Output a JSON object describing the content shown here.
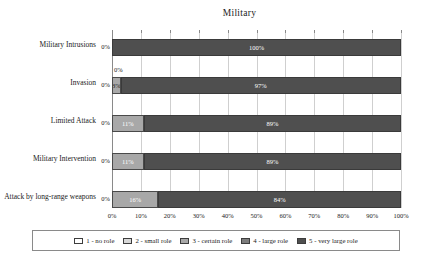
{
  "chart_data": {
    "type": "bar",
    "orientation": "horizontal",
    "stacked": true,
    "title": "Military",
    "xlabel": "",
    "ylabel": "",
    "xlim": [
      0,
      100
    ],
    "xticks": [
      "0%",
      "10%",
      "20%",
      "30%",
      "40%",
      "50%",
      "60%",
      "70%",
      "80%",
      "90%",
      "100%"
    ],
    "grid": true,
    "legend_position": "bottom",
    "categories": [
      "Military Intrusions",
      "Invasion",
      "Limited Attack",
      "Military Intervention",
      "Attack by long-range weapons"
    ],
    "series": [
      {
        "name": "1 - no role",
        "values": [
          0,
          0,
          0,
          0,
          0
        ]
      },
      {
        "name": "2 - small role",
        "values": [
          0,
          0,
          0,
          0,
          0
        ]
      },
      {
        "name": "3 - certain role",
        "values": [
          0,
          3,
          11,
          11,
          16
        ]
      },
      {
        "name": "4 - large role",
        "values": [
          0,
          0,
          0,
          0,
          0
        ]
      },
      {
        "name": "5 - very large role",
        "values": [
          100,
          97,
          89,
          89,
          84
        ]
      }
    ],
    "data_labels": {
      "Military Intrusions": [
        "0%",
        "100%"
      ],
      "Invasion": [
        "0%",
        "0%",
        "3%",
        "97%"
      ],
      "Limited Attack": [
        "0%",
        "11%",
        "89%"
      ],
      "Military Intervention": [
        "0%",
        "11%",
        "89%"
      ],
      "Attack by long-range weapons": [
        "0%",
        "16%",
        "84%"
      ]
    }
  },
  "title": {
    "text": "Military"
  },
  "axis": {
    "lead_zero_label": "0%",
    "ticks": [
      {
        "label": "0%",
        "value": 0
      },
      {
        "label": "10%",
        "value": 10
      },
      {
        "label": "20%",
        "value": 20
      },
      {
        "label": "30%",
        "value": 30
      },
      {
        "label": "40%",
        "value": 40
      },
      {
        "label": "50%",
        "value": 50
      },
      {
        "label": "60%",
        "value": 60
      },
      {
        "label": "70%",
        "value": 70
      },
      {
        "label": "80%",
        "value": 80
      },
      {
        "label": "90%",
        "value": 90
      },
      {
        "label": "100%",
        "value": 100
      }
    ]
  },
  "rows": [
    {
      "category": "Military Intrusions",
      "lead_zero": "0%",
      "segments": [
        {
          "series": 5,
          "value": 100,
          "label": "100%",
          "label_color": "light"
        }
      ],
      "outside_labels": []
    },
    {
      "category": "Invasion",
      "lead_zero": "0%",
      "segments": [
        {
          "series": 3,
          "value": 3,
          "label": "3%",
          "label_color": "dark"
        },
        {
          "series": 5,
          "value": 97,
          "label": "97%",
          "label_color": "light"
        }
      ],
      "outside_labels": [
        {
          "text": "0%",
          "left": 0,
          "top": -11
        }
      ]
    },
    {
      "category": "Limited Attack",
      "lead_zero": "0%",
      "segments": [
        {
          "series": 3,
          "value": 11,
          "label": "11%",
          "label_color": "light"
        },
        {
          "series": 5,
          "value": 89,
          "label": "89%",
          "label_color": "light"
        }
      ],
      "outside_labels": []
    },
    {
      "category": "Military Intervention",
      "lead_zero": "0%",
      "segments": [
        {
          "series": 3,
          "value": 11,
          "label": "11%",
          "label_color": "light"
        },
        {
          "series": 5,
          "value": 89,
          "label": "89%",
          "label_color": "light"
        }
      ],
      "outside_labels": []
    },
    {
      "category": "Attack by long-range weapons",
      "lead_zero": "0%",
      "segments": [
        {
          "series": 3,
          "value": 16,
          "label": "16%",
          "label_color": "light"
        },
        {
          "series": 5,
          "value": 84,
          "label": "84%",
          "label_color": "light"
        }
      ],
      "outside_labels": []
    }
  ],
  "legend": {
    "items": [
      {
        "label": "1 - no role",
        "series": 1,
        "color": "#ffffff"
      },
      {
        "label": "2 - small role",
        "series": 2,
        "color": "#d8d8d8"
      },
      {
        "label": "3 - certain role",
        "series": 3,
        "color": "#a8a8a8"
      },
      {
        "label": "4 - large role",
        "series": 4,
        "color": "#7d7d7d"
      },
      {
        "label": "5 - very large role",
        "series": 5,
        "color": "#4f4f4f"
      }
    ]
  },
  "colors": {
    "series_1": "#ffffff",
    "series_2": "#d8d8d8",
    "series_3": "#a8a8a8",
    "series_4": "#7d7d7d",
    "series_5": "#4f4f4f",
    "gridline": "#cfcfcf",
    "axis": "#8a8a8a",
    "text": "#1a1a1a",
    "background": "#ffffff"
  }
}
